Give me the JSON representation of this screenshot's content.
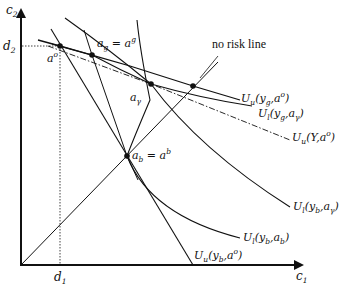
{
  "diagram": {
    "axes": {
      "x_label": "c",
      "x_label_sub": "1",
      "y_label": "c",
      "y_label_sub": "2"
    },
    "reference_marks": {
      "d1": {
        "base": "d",
        "sub": "1"
      },
      "d2": {
        "base": "d",
        "sub": "2"
      }
    },
    "points": {
      "a_o": {
        "base": "a",
        "sup": "o"
      },
      "a_g": {
        "text_left": "a",
        "sub_left": "g",
        "eq": " = ",
        "text_right": "a",
        "sup_right": "g"
      },
      "a_gamma": {
        "base": "a",
        "sub": "γ"
      },
      "a_b": {
        "text_left": "a",
        "sub_left": "b",
        "eq": " = ",
        "text_right": "a",
        "sup_right": "b"
      }
    },
    "no_risk_line_label": "no risk line",
    "curves": {
      "Uu_yg_ao": {
        "U": "U",
        "U_sub": "u",
        "args": "(y",
        "a_sub": "g",
        "rest": ",a",
        "rest_sup": "o",
        "close": ")"
      },
      "Ul_yg_agamma": {
        "U": "U",
        "U_sub": "l",
        "args": "(y",
        "a_sub": "g",
        "rest": ",a",
        "rest_sub": "γ",
        "close": ")"
      },
      "Uu_Y_ao": {
        "U": "U",
        "U_sub": "u",
        "args": "(Y,a",
        "rest_sup": "o",
        "close": ")"
      },
      "Ul_yb_agamma": {
        "U": "U",
        "U_sub": "l",
        "args": "(y",
        "a_sub": "b",
        "rest": ",a",
        "rest_sub": "γ",
        "close": ")"
      },
      "Ul_yb_ab": {
        "U": "U",
        "U_sub": "l",
        "args": "(y",
        "a_sub": "b",
        "rest": ",a",
        "rest_sub": "b",
        "close": ")"
      },
      "Uu_yb_ao": {
        "U": "U",
        "U_sub": "u",
        "args": "(y",
        "a_sub": "b",
        "rest": ",a",
        "rest_sup": "o",
        "close": ")"
      }
    },
    "colors": {
      "line": "#111111",
      "background": "#ffffff"
    }
  }
}
